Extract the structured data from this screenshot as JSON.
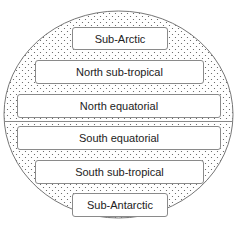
{
  "diagram": {
    "type": "zonal-belts-globe",
    "background_pattern": "dotted",
    "zones": [
      {
        "label": "Sub-Arctic"
      },
      {
        "label": "North sub-tropical"
      },
      {
        "label": "North equatorial"
      },
      {
        "label": "South equatorial"
      },
      {
        "label": "South sub-tropical"
      },
      {
        "label": "Sub-Antarctic"
      }
    ]
  }
}
